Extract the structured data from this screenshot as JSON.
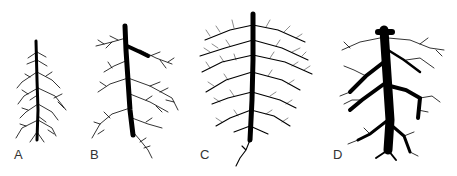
{
  "figure": {
    "panels": [
      {
        "id": "A",
        "label": "A",
        "description": "young root system with a thin taproot and sparse lateral roots"
      },
      {
        "id": "B",
        "label": "B",
        "description": "taproot with larger branching lateral roots"
      },
      {
        "id": "C",
        "label": "C",
        "description": "dense, highly branched fibrous root mass along a central taproot"
      },
      {
        "id": "D",
        "label": "D",
        "description": "thick, woody root system with large spreading main roots"
      }
    ],
    "colors": {
      "ink": "#000000",
      "background": "#ffffff",
      "label": "#333333"
    }
  }
}
